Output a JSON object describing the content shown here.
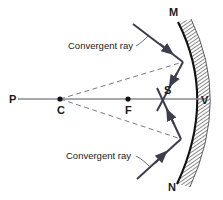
{
  "diagram": {
    "colors": {
      "ray_solid": "#3d3d4d",
      "ray_dashed": "#7a7a88",
      "axis": "#8a8a93",
      "mirror_surface": "#111111",
      "mirror_hatch": "#555555",
      "text": "#1a1a1a",
      "background": "#ffffff"
    },
    "point_labels": [
      {
        "id": "P",
        "text": "P",
        "x": 9,
        "y": 103
      },
      {
        "id": "C",
        "text": "C",
        "x": 57,
        "y": 114
      },
      {
        "id": "F",
        "text": "F",
        "x": 125,
        "y": 114
      },
      {
        "id": "S",
        "text": "S",
        "x": 164,
        "y": 94
      },
      {
        "id": "V",
        "text": "V",
        "x": 201,
        "y": 104
      },
      {
        "id": "M",
        "text": "M",
        "x": 169,
        "y": 16
      },
      {
        "id": "N",
        "text": "N",
        "x": 168,
        "y": 191
      }
    ],
    "annotations": [
      {
        "id": "convergent-ray-top",
        "text": "Convergent ray",
        "x": 68,
        "y": 49
      },
      {
        "id": "convergent-ray-bottom",
        "text": "Convergent ray",
        "x": 66,
        "y": 159
      }
    ],
    "axis": {
      "label": "principal axis",
      "x1": 18,
      "y1": 99,
      "x2": 205,
      "y2": 99
    },
    "mirror": {
      "label": "concave mirror MN",
      "top_x": 178,
      "top_y": 22,
      "vertex_x": 198,
      "vertex_y": 99,
      "bottom_x": 177,
      "bottom_y": 184,
      "hatch_thickness": 13
    },
    "marked_points": [
      {
        "id": "point-C",
        "label": "centre of curvature",
        "x": 60,
        "y": 99,
        "r": 2.6
      },
      {
        "id": "point-F",
        "label": "focus",
        "x": 128,
        "y": 99,
        "r": 2.6
      }
    ],
    "rays": [
      {
        "id": "incident-ray-upper",
        "kind": "solid",
        "from_x": 133,
        "from_y": 24,
        "to_x": 183,
        "to_y": 62,
        "arrow_at": 0.62
      },
      {
        "id": "incident-ray-lower",
        "kind": "solid",
        "from_x": 137,
        "from_y": 179,
        "to_x": 181,
        "to_y": 139,
        "arrow_at": 0.55
      },
      {
        "id": "reflected-ray-upper",
        "kind": "solid",
        "from_x": 183,
        "from_y": 62,
        "to_x": 157,
        "to_y": 111,
        "arrow_at": 0.42
      },
      {
        "id": "reflected-ray-lower",
        "kind": "solid",
        "from_x": 181,
        "from_y": 139,
        "to_x": 157,
        "to_y": 88,
        "arrow_at": 0.42
      },
      {
        "id": "construction-line-upper",
        "kind": "dashed",
        "from_x": 60,
        "from_y": 99,
        "to_x": 183,
        "to_y": 62
      },
      {
        "id": "construction-line-lower",
        "kind": "dashed",
        "from_x": 60,
        "from_y": 99,
        "to_x": 181,
        "to_y": 139
      }
    ],
    "leaders": [
      {
        "id": "leader-top",
        "x1": 136,
        "y1": 46,
        "x2": 148,
        "y2": 36
      },
      {
        "id": "leader-bottom",
        "x1": 136,
        "y1": 156,
        "x2": 150,
        "y2": 167
      }
    ]
  }
}
